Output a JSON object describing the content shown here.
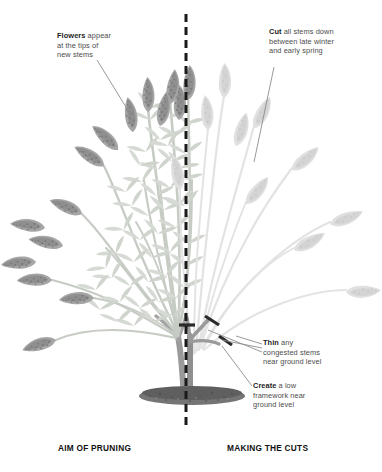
{
  "figure": {
    "kind": "pruning-diagram",
    "divider": {
      "style": "dashed-vertical",
      "x": 186,
      "color": "#1a1a1a"
    },
    "colors": {
      "ink": "#4c4c4c",
      "ink_bold": "#1d1d1d",
      "caption": "#111111",
      "leader_line": "#8d8d8d",
      "foliage_light": "#d8dcd6",
      "foliage_mid": "#c2c8c0",
      "flower_dark": "#9a9a9a",
      "flower_ghost": "#dedede",
      "stem_dark": "#8d8d8d",
      "stem_ghost": "#e2e2e2",
      "soil": "#6f6f6f",
      "cut_mark": "#2b2b2b",
      "background": "#ffffff"
    }
  },
  "labels": {
    "flowers": {
      "bold": "Flowers",
      "rest": " appear\nat the tips of\nnew stems"
    },
    "cut": {
      "bold": "Cut",
      "rest": " all stems down\nbetween late winter\nand early spring"
    },
    "thin": {
      "bold": "Thin",
      "rest": " any\ncongested stems\nnear ground level"
    },
    "create": {
      "bold": "Create",
      "rest": " a low\nframework near\nground level"
    }
  },
  "captions": {
    "left": "AIM OF PRUNING",
    "right": "MAKING THE CUTS"
  }
}
